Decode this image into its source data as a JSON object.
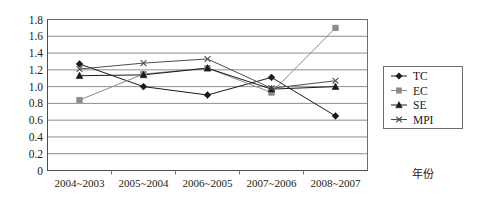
{
  "chart_data": {
    "type": "line",
    "title": "",
    "xlabel": "年份",
    "ylabel": "",
    "categories": [
      "2004~2003",
      "2005~2004",
      "2006~2005",
      "2007~2006",
      "2008~2007"
    ],
    "series": [
      {
        "name": "TC",
        "marker": "diamond",
        "color": "#1a1a1a",
        "values": [
          1.27,
          1.0,
          0.9,
          1.11,
          0.65
        ]
      },
      {
        "name": "EC",
        "marker": "square",
        "color": "#8c8c8c",
        "values": [
          0.84,
          1.15,
          1.22,
          0.93,
          1.7
        ]
      },
      {
        "name": "SE",
        "marker": "triangle",
        "color": "#1a1a1a",
        "values": [
          1.13,
          1.14,
          1.22,
          0.97,
          1.0
        ]
      },
      {
        "name": "MPI",
        "marker": "cross",
        "color": "#4d4d4d",
        "values": [
          1.21,
          1.28,
          1.33,
          0.98,
          1.07
        ]
      }
    ],
    "ylim": [
      0,
      1.8
    ],
    "ytick_labels": [
      "1.8",
      "1.6",
      "1.4",
      "1.2",
      "1.0",
      "0.8",
      "0.6",
      "0.4",
      "0.2",
      "0"
    ],
    "ytick_values": [
      1.8,
      1.6,
      1.4,
      1.2,
      1.0,
      0.8,
      0.6,
      0.4,
      0.2,
      0
    ],
    "grid": true,
    "legend_position": "right"
  },
  "legend": {
    "entries": [
      {
        "label": "TC"
      },
      {
        "label": "EC"
      },
      {
        "label": "SE"
      },
      {
        "label": "MPI"
      }
    ]
  }
}
